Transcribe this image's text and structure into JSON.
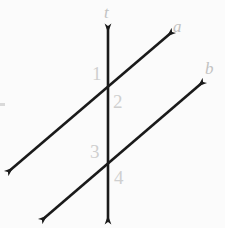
{
  "figure": {
    "background_color": "#fbfbfb",
    "stroke_color": "#1a1a1a",
    "label_color": "#c2c2c2",
    "numeral_color": "#cfcfcf",
    "width": 225,
    "height": 228
  },
  "lines": {
    "transversal": {
      "name": "t",
      "kind": "double-headed-arrow",
      "x1": 108,
      "y1": 26,
      "x2": 108,
      "y2": 222
    },
    "line_a": {
      "name": "a",
      "kind": "double-headed-arrow",
      "x1": 8,
      "y1": 172,
      "x2": 172,
      "y2": 32
    },
    "line_b": {
      "name": "b",
      "kind": "double-headed-arrow",
      "x1": 42,
      "y1": 220,
      "x2": 203,
      "y2": 82
    }
  },
  "intersections": [
    {
      "name": "upper-intersection",
      "x": 108,
      "y": 95,
      "lines": "t and a"
    },
    {
      "name": "lower-intersection",
      "x": 108,
      "y": 168,
      "lines": "t and b"
    }
  ],
  "labels": {
    "t": "t",
    "a": "a",
    "b": "b"
  },
  "angle_numbers": {
    "one": "1",
    "two": "2",
    "three": "3",
    "four": "4"
  }
}
